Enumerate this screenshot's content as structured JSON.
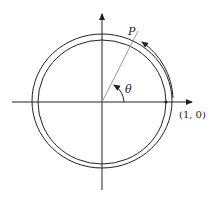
{
  "diagram": {
    "labels": {
      "point": "P",
      "angle": "θ",
      "start_point": "(1, 0)"
    },
    "colors": {
      "stroke": "#222222",
      "radius_line": "#999999",
      "background": "#ffffff"
    }
  }
}
